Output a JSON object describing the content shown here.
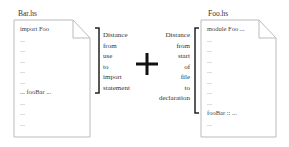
{
  "bar_file": {
    "title": "Bar.hs",
    "lines": [
      "import Foo",
      "...",
      "...",
      "...",
      "...",
      "...",
      "... fooBar ...",
      "...",
      "...",
      "..."
    ]
  },
  "left_annotation": {
    "lines": [
      "Distance",
      "from",
      "use",
      "to",
      "import",
      "statement"
    ]
  },
  "operator": "+",
  "right_annotation": {
    "lines": [
      "Distance",
      "from",
      "start",
      "of",
      "file",
      "to",
      "declaration"
    ]
  },
  "foo_file": {
    "title": "Foo.hs",
    "lines": [
      "module Foo ...",
      "...",
      "...",
      "...",
      "...",
      "...",
      "...",
      "...",
      "fooBar :: ...",
      "..."
    ]
  }
}
